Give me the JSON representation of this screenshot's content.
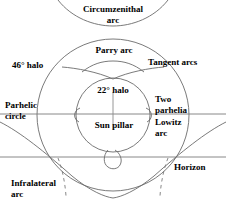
{
  "diagram": {
    "colors": {
      "stroke": "#6b6b6b",
      "stroke_dark": "#555555",
      "text": "#000000",
      "background": "#ffffff"
    },
    "labels": [
      {
        "id": "circumzenithal-arc",
        "line1": "Circumzenithal",
        "line2": "arc"
      },
      {
        "id": "parry-arc",
        "line1": "Parry arc",
        "line2": ""
      },
      {
        "id": "tangent-arcs",
        "line1": "Tangent arcs",
        "line2": ""
      },
      {
        "id": "halo-46",
        "line1": "46° halo",
        "line2": ""
      },
      {
        "id": "halo-22",
        "line1": "22° halo",
        "line2": ""
      },
      {
        "id": "parhelic-circle",
        "line1": "Parhelic",
        "line2": "circle"
      },
      {
        "id": "two-parhelia",
        "line1": "Two",
        "line2": "parhelia"
      },
      {
        "id": "sun-pillar",
        "line1": "Sun pillar",
        "line2": ""
      },
      {
        "id": "lowitz-arc",
        "line1": "Lowitz",
        "line2": "arc"
      },
      {
        "id": "horizon",
        "line1": "Horizon",
        "line2": ""
      },
      {
        "id": "infralateral-arc",
        "line1": "Infralateral",
        "line2": "arc"
      }
    ],
    "features": {
      "halo_22_degrees": "22",
      "halo_46_degrees": "46",
      "degree_symbol": "°"
    },
    "geometry": {
      "center_x": 113,
      "center_y": 115,
      "halo_22_radius": 37,
      "halo_46_radius": 76,
      "parhelic_circle_y": 114,
      "horizon_y": 157
    }
  }
}
